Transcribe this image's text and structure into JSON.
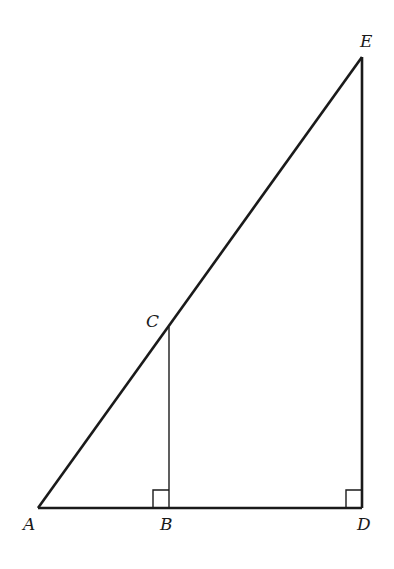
{
  "diagram": {
    "type": "geometry-similar-triangles",
    "stroke_color": "#1a1a1a",
    "background": "#ffffff",
    "points": {
      "A": {
        "label": "A",
        "x": 38,
        "y": 508
      },
      "B": {
        "label": "B",
        "x": 169,
        "y": 508
      },
      "C": {
        "label": "C",
        "x": 169,
        "y": 327
      },
      "D": {
        "label": "D",
        "x": 362,
        "y": 508
      },
      "E": {
        "label": "E",
        "x": 362,
        "y": 57
      }
    },
    "segments": [
      "AE",
      "AD",
      "BC",
      "DE"
    ],
    "right_angles": [
      "B",
      "D"
    ]
  }
}
